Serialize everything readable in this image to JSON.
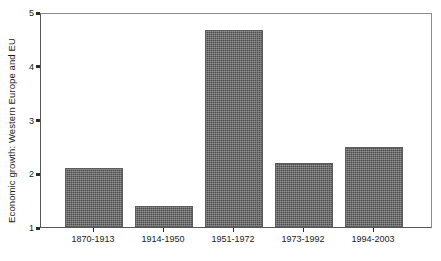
{
  "chart_data": {
    "type": "bar",
    "title": "",
    "xlabel": "",
    "ylabel": "Economic growth: Western Europe and EU",
    "categories": [
      "1870-1913",
      "1914-1950",
      "1951-1972",
      "1973-1992",
      "1994-2003"
    ],
    "values": [
      2.1,
      1.4,
      4.7,
      2.2,
      2.5
    ],
    "ylim": [
      1,
      5
    ],
    "yticks": [
      "1",
      "2",
      "3",
      "4",
      "5"
    ],
    "grid": false,
    "legend": null,
    "bar_color": "#4e4e4e",
    "axis_color": "#2a2a2a",
    "background": "#ffffff"
  }
}
